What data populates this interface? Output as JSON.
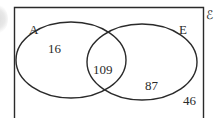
{
  "diagram": {
    "type": "venn",
    "universal_symbol": "ℰ",
    "sets": [
      {
        "label": "A"
      },
      {
        "label": "E"
      }
    ],
    "regions": {
      "a_only": "16",
      "a_and_e": "109",
      "e_only": "87",
      "neither": "46"
    },
    "colors": {
      "stroke": "#2a2a2a",
      "background": "#ffffff"
    }
  }
}
